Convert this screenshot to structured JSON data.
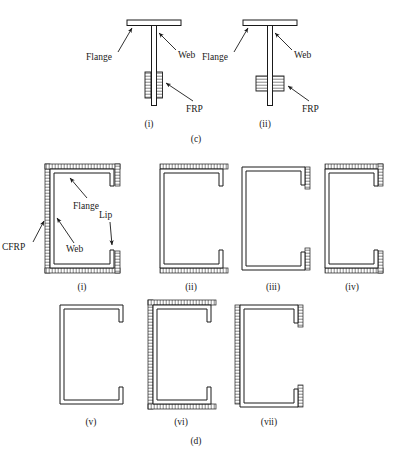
{
  "figure": {
    "panels": [
      {
        "id": "c",
        "caption": "(c)",
        "description": "T-section beams with FRP strengthening on web",
        "items": [
          {
            "caption": "(i)",
            "labels": [
              "Flange",
              "Web",
              "FRP"
            ],
            "frp_style": "long vertical strips on both sides of web"
          },
          {
            "caption": "(ii)",
            "labels": [
              "Flange",
              "Web",
              "FRP"
            ],
            "frp_style": "short wide patches on both sides of web"
          }
        ]
      },
      {
        "id": "d",
        "caption": "(d)",
        "description": "Lipped channel sections with CFRP strengthening configurations",
        "items": [
          {
            "caption": "(i)",
            "labels": [
              "CFRP",
              "Flange",
              "Web",
              "Lip"
            ],
            "cfrp": [
              "web",
              "flanges",
              "lips"
            ]
          },
          {
            "caption": "(ii)",
            "labels": [],
            "cfrp": [
              "flanges"
            ]
          },
          {
            "caption": "(iii)",
            "labels": [],
            "cfrp": [
              "lips"
            ]
          },
          {
            "caption": "(iv)",
            "labels": [],
            "cfrp": [
              "flanges",
              "lips"
            ]
          },
          {
            "caption": "(v)",
            "labels": [],
            "cfrp": []
          },
          {
            "caption": "(vi)",
            "labels": [],
            "cfrp": [
              "web",
              "flanges"
            ]
          },
          {
            "caption": "(vii)",
            "labels": [],
            "cfrp": [
              "web",
              "lips"
            ]
          }
        ]
      }
    ],
    "labels": {
      "flange": "Flange",
      "web": "Web",
      "frp": "FRP",
      "cfrp": "CFRP",
      "lip": "Lip"
    },
    "captions": {
      "panel_c": "(c)",
      "panel_d": "(d)",
      "c_i": "(i)",
      "c_ii": "(ii)",
      "d_i": "(i)",
      "d_ii": "(ii)",
      "d_iii": "(iii)",
      "d_iv": "(iv)",
      "d_v": "(v)",
      "d_vi": "(vi)",
      "d_vii": "(vii)"
    },
    "colors": {
      "stroke": "#1a1a1a",
      "fill": "#ffffff",
      "hatch": "#333333"
    }
  }
}
